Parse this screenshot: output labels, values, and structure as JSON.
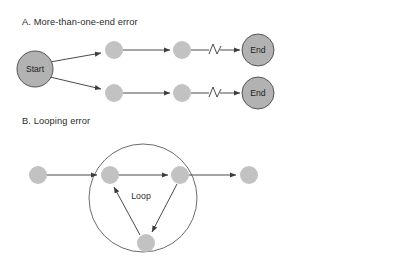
{
  "figure": {
    "background_color": "#ffffff",
    "width": 393,
    "height": 265,
    "panels": [
      {
        "id": "panel-a",
        "heading": "A. More-than-one-end error",
        "heading_x": 22,
        "heading_y": 25,
        "nodes": [
          {
            "id": "a-start",
            "label": "Start",
            "type": "terminal",
            "cx": 35,
            "cy": 69,
            "r": 18
          },
          {
            "id": "a-top-1",
            "label": "",
            "type": "step",
            "cx": 114,
            "cy": 50,
            "r": 9
          },
          {
            "id": "a-top-2",
            "label": "",
            "type": "step",
            "cx": 182,
            "cy": 50,
            "r": 9
          },
          {
            "id": "a-top-end",
            "label": "End",
            "type": "terminal",
            "cx": 258,
            "cy": 50,
            "r": 16
          },
          {
            "id": "a-bot-1",
            "label": "",
            "type": "step",
            "cx": 114,
            "cy": 93,
            "r": 9
          },
          {
            "id": "a-bot-2",
            "label": "",
            "type": "step",
            "cx": 182,
            "cy": 93,
            "r": 9
          },
          {
            "id": "a-bot-end",
            "label": "End",
            "type": "terminal",
            "cx": 258,
            "cy": 93,
            "r": 16
          }
        ],
        "edges": [
          {
            "id": "a-edge-start-top",
            "from": "a-start",
            "to": "a-top-1",
            "arrow": true,
            "break": false
          },
          {
            "id": "a-edge-start-bot",
            "from": "a-start",
            "to": "a-bot-1",
            "arrow": true,
            "break": false
          },
          {
            "id": "a-edge-top-12",
            "from": "a-top-1",
            "to": "a-top-2",
            "arrow": true,
            "break": false
          },
          {
            "id": "a-edge-top-2end",
            "from": "a-top-2",
            "to": "a-top-end",
            "arrow": true,
            "break": true
          },
          {
            "id": "a-edge-bot-12",
            "from": "a-bot-1",
            "to": "a-bot-2",
            "arrow": true,
            "break": false
          },
          {
            "id": "a-edge-bot-2end",
            "from": "a-bot-2",
            "to": "a-bot-end",
            "arrow": true,
            "break": true
          }
        ]
      },
      {
        "id": "panel-b",
        "heading": "B. Looping error",
        "heading_x": 22,
        "heading_y": 124,
        "loop_label": "Loop",
        "loop_label_x": 141,
        "loop_label_y": 196,
        "loop_circle": {
          "cx": 143,
          "cy": 198,
          "r": 54
        },
        "nodes": [
          {
            "id": "b-entry",
            "label": "",
            "type": "step",
            "cx": 38,
            "cy": 175,
            "r": 9
          },
          {
            "id": "b-loop-l",
            "label": "",
            "type": "step",
            "cx": 110,
            "cy": 175,
            "r": 9
          },
          {
            "id": "b-loop-r",
            "label": "",
            "type": "step",
            "cx": 180,
            "cy": 175,
            "r": 9
          },
          {
            "id": "b-loop-b",
            "label": "",
            "type": "step",
            "cx": 146,
            "cy": 243,
            "r": 9
          },
          {
            "id": "b-exit",
            "label": "",
            "type": "step",
            "cx": 249,
            "cy": 175,
            "r": 9
          }
        ],
        "edges": [
          {
            "id": "b-edge-entry-l",
            "from": "b-entry",
            "to": "b-loop-l",
            "arrow": true,
            "break": false
          },
          {
            "id": "b-edge-l-r",
            "from": "b-loop-l",
            "to": "b-loop-r",
            "arrow": true,
            "break": false
          },
          {
            "id": "b-edge-r-exit",
            "from": "b-loop-r",
            "to": "b-exit",
            "arrow": true,
            "break": false
          },
          {
            "id": "b-edge-r-b",
            "from": "b-loop-r",
            "to": "b-loop-b",
            "arrow": true,
            "break": false
          },
          {
            "id": "b-edge-b-l",
            "from": "b-loop-b",
            "to": "b-loop-l",
            "arrow": true,
            "break": false
          }
        ]
      }
    ],
    "colors": {
      "terminal_node_fill": "#b2b2b2",
      "terminal_node_stroke": "#555555",
      "step_node_fill": "#c2c2c2",
      "edge_stroke": "#4a4a4a",
      "loop_boundary_stroke": "#5a5a5a",
      "text_color": "#2b2b2b"
    }
  }
}
